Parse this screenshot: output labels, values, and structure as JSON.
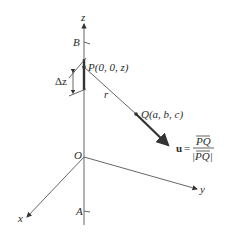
{
  "diagram": {
    "axes": {
      "z_label": "z",
      "x_label": "x",
      "y_label": "y",
      "origin_label": "O"
    },
    "points": {
      "B_label": "B",
      "A_label": "A",
      "P_label": "P(0, 0, z)",
      "Q_label": "Q(a, b, c)"
    },
    "segment": {
      "delta_label": "Δz",
      "r_label": "r"
    },
    "unit_vector": {
      "symbol": "u",
      "equals": "=",
      "numerator": "PQ",
      "denominator": "|PQ|"
    },
    "colors": {
      "line": "#555555",
      "ink": "#2a2a2a"
    }
  }
}
